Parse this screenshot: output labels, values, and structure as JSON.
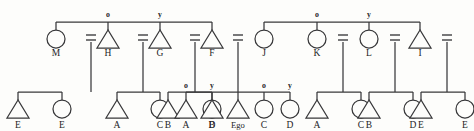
{
  "diagram": {
    "type": "kinship-genealogy",
    "colors": {
      "background": "#fdfdfb",
      "line": "#38383a",
      "text": "#232325"
    },
    "symbol_legend": {
      "triangle": "male",
      "circle": "female",
      "equals": "marriage",
      "o": "older sibling",
      "y": "younger sibling"
    },
    "generation_1": {
      "sibling_groups": [
        {
          "id": "g1-left",
          "bar": {
            "x1": 56,
            "x2": 212,
            "y": 22
          },
          "members": [
            {
              "label": "M",
              "symbol": "circle",
              "x": 56,
              "rank": ""
            },
            {
              "label": "H",
              "symbol": "triangle",
              "x": 108,
              "rank": "o"
            },
            {
              "label": "G",
              "symbol": "triangle",
              "x": 160,
              "rank": "y"
            },
            {
              "label": "F",
              "symbol": "triangle",
              "x": 212,
              "rank": ""
            }
          ]
        },
        {
          "id": "g1-right",
          "bar": {
            "x1": 264,
            "x2": 420,
            "y": 22
          },
          "members": [
            {
              "label": "J",
              "symbol": "circle",
              "x": 264,
              "rank": ""
            },
            {
              "label": "K",
              "symbol": "circle",
              "x": 317,
              "rank": "o"
            },
            {
              "label": "L",
              "symbol": "circle",
              "x": 369,
              "rank": "y"
            },
            {
              "label": "I",
              "symbol": "triangle",
              "x": 420,
              "rank": ""
            }
          ]
        }
      ]
    },
    "marriages": [
      {
        "id": "m-M",
        "x": 91,
        "spouse_of": "M",
        "children_bar": {
          "x1": 18,
          "x2": 62,
          "y": 92
        }
      },
      {
        "id": "m-H",
        "x": 143,
        "spouse_of": "H",
        "children_bar": {
          "x1": 117,
          "x2": 160,
          "y": 92
        }
      },
      {
        "id": "m-G",
        "x": 195,
        "spouse_of": "G",
        "children_bar": {
          "x1": 168,
          "x2": 212,
          "y": 92
        }
      },
      {
        "id": "m-F-J",
        "x": 238,
        "spouse_of": "F and J",
        "children_bar": {
          "x1": 186,
          "x2": 290,
          "y": 92
        }
      },
      {
        "id": "m-K",
        "x": 343,
        "spouse_of": "K",
        "children_bar": {
          "x1": 317,
          "x2": 361,
          "y": 92
        }
      },
      {
        "id": "m-L",
        "x": 395,
        "spouse_of": "L",
        "children_bar": {
          "x1": 369,
          "x2": 413,
          "y": 92
        }
      },
      {
        "id": "m-I",
        "x": 447,
        "spouse_of": "I",
        "children_bar": {
          "x1": 421,
          "x2": 465,
          "y": 92
        }
      }
    ],
    "generation_2": {
      "children": [
        {
          "label": "E",
          "symbol": "triangle",
          "x": 18,
          "rank": "",
          "parent": "m-M"
        },
        {
          "label": "E",
          "symbol": "circle",
          "x": 62,
          "rank": "",
          "parent": "m-M"
        },
        {
          "label": "A",
          "symbol": "triangle",
          "x": 117,
          "rank": "",
          "parent": "m-H"
        },
        {
          "label": "C",
          "symbol": "circle",
          "x": 160,
          "rank": "",
          "parent": "m-H"
        },
        {
          "label": "B",
          "symbol": "triangle",
          "x": 168,
          "rank": "",
          "parent": "m-G"
        },
        {
          "label": "D",
          "symbol": "circle",
          "x": 212,
          "rank": "",
          "parent": "m-G"
        },
        {
          "label": "A",
          "symbol": "triangle",
          "x": 186,
          "rank": "o",
          "parent": "m-F-J"
        },
        {
          "label": "B",
          "symbol": "triangle",
          "x": 212,
          "rank": "y",
          "parent": "m-F-J"
        },
        {
          "label": "Ego",
          "symbol": "triangle",
          "x": 238,
          "rank": "",
          "parent": "m-F-J"
        },
        {
          "label": "C",
          "symbol": "circle",
          "x": 264,
          "rank": "o",
          "parent": "m-F-J"
        },
        {
          "label": "D",
          "symbol": "circle",
          "x": 290,
          "rank": "y",
          "parent": "m-F-J"
        },
        {
          "label": "A",
          "symbol": "triangle",
          "x": 317,
          "rank": "",
          "parent": "m-K"
        },
        {
          "label": "C",
          "symbol": "circle",
          "x": 361,
          "rank": "",
          "parent": "m-K"
        },
        {
          "label": "B",
          "symbol": "triangle",
          "x": 369,
          "rank": "",
          "parent": "m-L"
        },
        {
          "label": "D",
          "symbol": "circle",
          "x": 413,
          "rank": "",
          "parent": "m-L"
        },
        {
          "label": "E",
          "symbol": "triangle",
          "x": 421,
          "rank": "",
          "parent": "m-I"
        },
        {
          "label": "E",
          "symbol": "circle",
          "x": 465,
          "rank": "",
          "parent": "m-I"
        }
      ]
    },
    "geometry": {
      "gen1_bar_y": 22,
      "gen1_symbol_top": 30,
      "gen1_symbol_bottom": 48,
      "gen1_label_y": 56,
      "gen1_rank_y": 17,
      "marriage_y_top": 35,
      "marriage_y_bottom": 40,
      "marriage_stem_end": 92,
      "gen2_bar_y": 92,
      "gen2_symbol_top": 100,
      "gen2_symbol_bottom": 118,
      "gen2_label_y": 128,
      "gen2_rank_y": 88,
      "triangle_half_width": 11,
      "circle_radius": 9
    }
  }
}
